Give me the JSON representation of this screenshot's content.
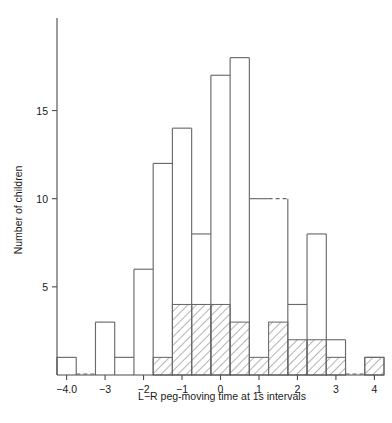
{
  "figure": {
    "name": "histogram-l-r-peg-moving-time",
    "background": "#ffffff",
    "line_color": "#6a6a6a",
    "axis_color": "#4a4a4a",
    "text_color": "#1a1a1a"
  },
  "chart_data": {
    "type": "bar",
    "title": "",
    "subtitle": "",
    "xlabel": "L−R peg-moving time at 1s intervals",
    "ylabel": "Number of children",
    "xlim": [
      -4.25,
      4.25
    ],
    "ylim": [
      0,
      19
    ],
    "bin_width": 0.5,
    "grid": false,
    "legend": "none",
    "x_tick_labels": [
      "−4.0",
      "−3",
      "−2",
      "−1",
      "0",
      "1",
      "2",
      "3",
      "4"
    ],
    "x_tick_values": [
      -4,
      -3,
      -2,
      -1,
      0,
      1,
      2,
      3,
      4
    ],
    "y_tick_labels": [
      "5",
      "10",
      "15"
    ],
    "y_tick_values": [
      5,
      10,
      15
    ],
    "bin_starts": [
      -4.25,
      -3.75,
      -3.25,
      -2.75,
      -2.25,
      -1.75,
      -1.25,
      -0.75,
      -0.25,
      0.25,
      0.75,
      1.25,
      1.75,
      2.25,
      2.75,
      3.25,
      3.75
    ],
    "series": [
      {
        "name": "All children (open outline)",
        "style": "open-outline",
        "values": [
          1,
          0,
          3,
          1,
          6,
          12,
          14,
          8,
          17,
          18,
          10,
          10,
          4,
          8,
          2,
          0,
          1
        ]
      },
      {
        "name": "Subgroup (hatched)",
        "style": "diagonal-hatch",
        "values": [
          0,
          0,
          0,
          0,
          0,
          1,
          4,
          4,
          4,
          3,
          1,
          3,
          2,
          2,
          1,
          0,
          1
        ]
      }
    ],
    "annotations": [
      "Dashed bar tops mark bins shared with the adjacent interval outline",
      "Hatched bars are nested inside the open outline bars"
    ]
  }
}
